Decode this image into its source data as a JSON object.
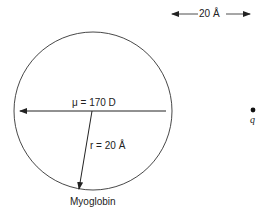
{
  "diagram": {
    "scale_bar": {
      "label": "20 Å"
    },
    "dipole": {
      "label": "μ = 170 D"
    },
    "radius": {
      "label": "r = 20 Å"
    },
    "protein": {
      "label": "Myoglobin"
    },
    "charge": {
      "label": "q"
    }
  },
  "colors": {
    "stroke": "#222222",
    "background": "#ffffff"
  }
}
